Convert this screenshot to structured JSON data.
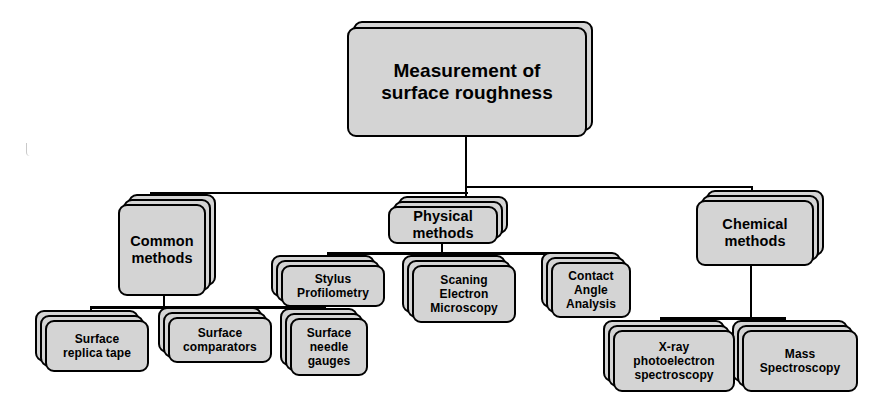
{
  "diagram": {
    "title": "Measurement of surface roughness",
    "type": "hierarchical-tree",
    "root": {
      "id": "root",
      "label": "Measurement of\nsurface roughness",
      "line1": "Measurement of",
      "line2": "surface roughness"
    },
    "branches": [
      {
        "id": "common-methods",
        "label": "Common\nmethods",
        "line1": "Common",
        "line2": "methods",
        "children": [
          {
            "id": "surface-replica-tape",
            "line1": "Surface",
            "line2": "replica tape",
            "line3": ""
          },
          {
            "id": "surface-comparators",
            "line1": "Surface",
            "line2": "comparators",
            "line3": ""
          },
          {
            "id": "surface-needle-gauges",
            "line1": "Surface",
            "line2": "needle",
            "line3": "gauges"
          }
        ]
      },
      {
        "id": "physical-methods",
        "label": "Physical\nmethods",
        "line1": "Physical",
        "line2": "methods",
        "children": [
          {
            "id": "stylus-profilometry",
            "line1": "Stylus",
            "line2": "Profilometry",
            "line3": ""
          },
          {
            "id": "scanning-electron-microscopy",
            "line1": "Scaning",
            "line2": "Electron",
            "line3": "Microscopy"
          },
          {
            "id": "contact-angle-analysis",
            "line1": "Contact",
            "line2": "Angle",
            "line3": "Analysis"
          }
        ]
      },
      {
        "id": "chemical-methods",
        "label": "Chemical\nmethods",
        "line1": "Chemical",
        "line2": "methods",
        "children": [
          {
            "id": "xray-photoelectron-spectroscopy",
            "line1": "X-ray",
            "line2": "photoelectron",
            "line3": "spectroscopy"
          },
          {
            "id": "mass-spectroscopy",
            "line1": "Mass",
            "line2": "Spectroscopy",
            "line3": ""
          }
        ]
      }
    ],
    "colors": {
      "box_fill": "#d4d4d4",
      "box_border": "#000000",
      "text": "#000000",
      "background": "#ffffff",
      "connector": "#000000"
    }
  }
}
